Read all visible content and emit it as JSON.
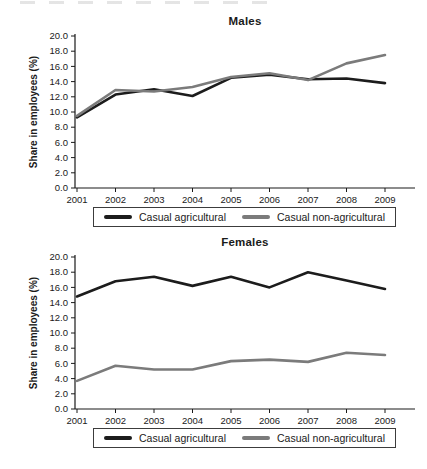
{
  "chart_data": [
    {
      "type": "line",
      "title": "Males",
      "ylabel": "Share in employees (%)",
      "xlabel": "",
      "categories": [
        "2001",
        "2002",
        "2003",
        "2004",
        "2005",
        "2006",
        "2007",
        "2008",
        "2009"
      ],
      "series": [
        {
          "name": "Casual agricultural",
          "color": "#1c1c1c",
          "values": [
            9.3,
            12.3,
            13.0,
            12.1,
            14.5,
            14.9,
            14.3,
            14.4,
            13.8
          ]
        },
        {
          "name": "Casual non-agricultural",
          "color": "#7b7b7b",
          "values": [
            9.5,
            12.9,
            12.7,
            13.3,
            14.6,
            15.1,
            14.2,
            16.4,
            17.5
          ]
        }
      ],
      "ylim": [
        0,
        20
      ],
      "y_step": 2,
      "y_tick_labels": [
        "0.0",
        "2.0",
        "4.0",
        "6.0",
        "8.0",
        "10.0",
        "12.0",
        "14.0",
        "16.0",
        "18.0",
        "20.0"
      ],
      "grid": false,
      "legend_position": "bottom"
    },
    {
      "type": "line",
      "title": "Females",
      "ylabel": "Share in employees (%)",
      "xlabel": "",
      "categories": [
        "2001",
        "2002",
        "2003",
        "2004",
        "2005",
        "2006",
        "2007",
        "2008",
        "2009"
      ],
      "series": [
        {
          "name": "Casual agricultural",
          "color": "#1c1c1c",
          "values": [
            14.8,
            16.8,
            17.4,
            16.2,
            17.4,
            16.0,
            18.0,
            16.9,
            15.8
          ]
        },
        {
          "name": "Casual non-agricultural",
          "color": "#7b7b7b",
          "values": [
            3.7,
            5.7,
            5.2,
            5.2,
            6.3,
            6.5,
            6.2,
            7.4,
            7.1
          ]
        }
      ],
      "ylim": [
        0,
        20
      ],
      "y_step": 2,
      "y_tick_labels": [
        "0.0",
        "2.0",
        "4.0",
        "6.0",
        "8.0",
        "10.0",
        "12.0",
        "14.0",
        "16.0",
        "18.0",
        "20.0"
      ],
      "grid": false,
      "legend_position": "bottom"
    }
  ]
}
